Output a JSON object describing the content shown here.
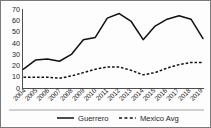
{
  "chart_data": {
    "type": "line",
    "title": "",
    "xlabel": "",
    "ylabel": "",
    "ylim": [
      0,
      70
    ],
    "yticks": [
      0,
      10,
      20,
      30,
      40,
      50,
      60,
      70
    ],
    "grid": false,
    "legend_position": "bottom",
    "categories": [
      "2004",
      "2005",
      "2006",
      "2007",
      "2008",
      "2009",
      "2010",
      "2011",
      "2012",
      "2013",
      "2014",
      "2015",
      "2016",
      "2017",
      "2018",
      "2019"
    ],
    "series": [
      {
        "name": "Guerrero",
        "style": "solid",
        "color": "#111111",
        "values": [
          17,
          25,
          26,
          24,
          30,
          43,
          45,
          62,
          66,
          59,
          43,
          55,
          61,
          64,
          61,
          44
        ]
      },
      {
        "name": "Mexico Avg",
        "style": "dashed",
        "color": "#111111",
        "values": [
          10,
          10,
          10,
          9,
          11,
          14,
          17,
          19,
          19,
          16,
          12,
          14,
          18,
          21,
          23,
          23
        ]
      }
    ]
  },
  "axes": {
    "ytick_labels": [
      "70",
      "60",
      "50",
      "40",
      "30",
      "20",
      "10",
      "0"
    ],
    "xtick_labels": [
      "2004",
      "2005",
      "2006",
      "2007",
      "2008",
      "2009",
      "2010",
      "2011",
      "2012",
      "2013",
      "2014",
      "2015",
      "2016",
      "2017",
      "2018",
      "2019"
    ]
  },
  "legend": {
    "entries": [
      {
        "label": "Guerrero",
        "style": "solid"
      },
      {
        "label": "Mexico Avg",
        "style": "dashed"
      }
    ]
  }
}
